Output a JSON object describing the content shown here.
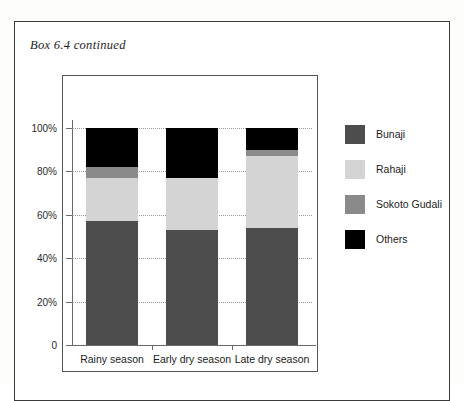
{
  "page": {
    "caption": "Box 6.4 continued",
    "background_color": "#ffffff",
    "border_color": "#3a3a3a"
  },
  "chart_data": {
    "type": "bar",
    "subtype": "stacked-percentage",
    "title": "",
    "xlabel": "",
    "ylabel": "",
    "categories": [
      "Rainy season",
      "Early dry season",
      "Late dry season"
    ],
    "ylim": [
      0,
      100
    ],
    "ytick_labels": [
      "0",
      "20%",
      "40%",
      "60%",
      "80%",
      "100%"
    ],
    "ytick_values": [
      0,
      20,
      40,
      60,
      80,
      100
    ],
    "grid": true,
    "grid_style": "dotted",
    "legend_position": "right",
    "series": [
      {
        "name": "Bunaji",
        "color": "#4d4d4d",
        "values": [
          57,
          53,
          54
        ]
      },
      {
        "name": "Rahaji",
        "color": "#d4d4d4",
        "values": [
          20,
          24,
          33
        ]
      },
      {
        "name": "Sokoto Gudali",
        "color": "#8a8a8a",
        "values": [
          5,
          0,
          3
        ]
      },
      {
        "name": "Others",
        "color": "#000000",
        "values": [
          18,
          23,
          10
        ]
      }
    ]
  }
}
